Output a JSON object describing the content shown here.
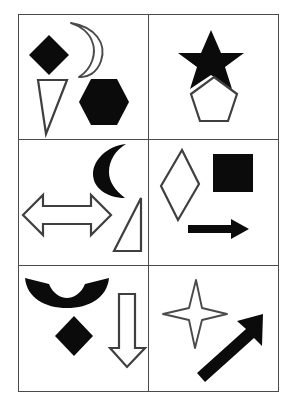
{
  "page": {
    "background_color": "#ffffff",
    "border_color": "#4a4a4a",
    "fill_color": "#0b0b0b",
    "width": 293,
    "height": 415
  },
  "grid": {
    "rows": 3,
    "columns": 2,
    "cells": [
      {
        "index": 1,
        "position": "top-left",
        "shape_count": 4,
        "shapes": [
          {
            "name": "diamond",
            "style": "filled",
            "label": "Filled Diamond"
          },
          {
            "name": "crescent-moon",
            "style": "outlined",
            "label": "Outlined Crescent Moon"
          },
          {
            "name": "triangle",
            "style": "outlined",
            "label": "Outlined Narrow Triangle"
          },
          {
            "name": "hexagon",
            "style": "filled",
            "label": "Filled Hexagon"
          }
        ]
      },
      {
        "index": 2,
        "position": "top-right",
        "shape_count": 2,
        "shapes": [
          {
            "name": "five-point-star",
            "style": "filled",
            "label": "Filled Five-Point Star"
          },
          {
            "name": "pentagon",
            "style": "outlined",
            "label": "Outlined Pentagon"
          }
        ]
      },
      {
        "index": 3,
        "position": "middle-left",
        "shape_count": 3,
        "shapes": [
          {
            "name": "crescent-moon",
            "style": "filled",
            "label": "Filled Crescent Moon"
          },
          {
            "name": "double-headed-arrow",
            "style": "outlined",
            "label": "Outlined Left-Right Arrow"
          },
          {
            "name": "right-triangle",
            "style": "outlined",
            "label": "Outlined Right Triangle"
          }
        ]
      },
      {
        "index": 4,
        "position": "middle-right",
        "shape_count": 3,
        "shapes": [
          {
            "name": "rhombus",
            "style": "outlined",
            "label": "Outlined Tall Rhombus"
          },
          {
            "name": "square",
            "style": "filled",
            "label": "Filled Square"
          },
          {
            "name": "right-arrow",
            "style": "filled",
            "label": "Filled Right Arrow"
          }
        ]
      },
      {
        "index": 5,
        "position": "bottom-left",
        "shape_count": 3,
        "shapes": [
          {
            "name": "crescent-arc",
            "style": "filled",
            "label": "Filled Upward Crescent Arc"
          },
          {
            "name": "diamond",
            "style": "filled",
            "label": "Filled Diamond"
          },
          {
            "name": "down-arrow",
            "style": "outlined",
            "label": "Outlined Down Arrow"
          }
        ]
      },
      {
        "index": 6,
        "position": "bottom-right",
        "shape_count": 2,
        "shapes": [
          {
            "name": "four-point-star",
            "style": "outlined",
            "label": "Outlined Four-Point Star"
          },
          {
            "name": "diagonal-arrow",
            "style": "filled",
            "label": "Filled Up-Right Diagonal Arrow"
          }
        ]
      }
    ]
  }
}
